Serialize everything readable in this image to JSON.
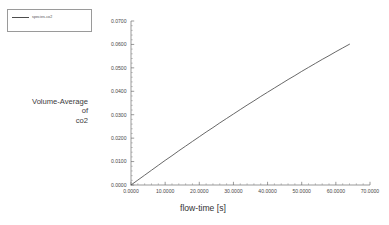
{
  "chart_data": {
    "type": "line",
    "title": "",
    "xlabel": "flow-time [s]",
    "ylabel": "Volume-Average\nof\nco2",
    "ylabel_lines": [
      "Volume-Average",
      "of",
      "co2"
    ],
    "xlim": [
      0.0,
      70.0
    ],
    "ylim": [
      0.0,
      0.07
    ],
    "xticks": [
      0.0,
      10.0,
      20.0,
      30.0,
      40.0,
      50.0,
      60.0,
      70.0
    ],
    "xticklabels": [
      "0.0000",
      "10.0000",
      "20.0000",
      "30.0000",
      "40.0000",
      "50.0000",
      "60.0000",
      "70.0000"
    ],
    "yticks": [
      0.0,
      0.01,
      0.02,
      0.03,
      0.04,
      0.05,
      0.06,
      0.07
    ],
    "yticklabels": [
      "0.0000",
      "0.0100",
      "0.0200",
      "0.0300",
      "0.0400",
      "0.0500",
      "0.0600",
      "0.0700"
    ],
    "x_minor_per_major": 5,
    "y_minor_per_major": 5,
    "grid": false,
    "legend_position": "outside-top-left",
    "legend_entries": [
      "species-co2"
    ],
    "series": [
      {
        "name": "species-co2",
        "color": "#4d4d4d",
        "x": [
          0,
          2,
          4,
          6,
          8,
          10,
          12,
          14,
          16,
          18,
          20,
          22,
          24,
          26,
          28,
          30,
          32,
          34,
          36,
          38,
          40,
          42,
          44,
          46,
          48,
          50,
          52,
          54,
          56,
          58,
          60,
          62,
          64
        ],
        "y": [
          0.0,
          0.0021,
          0.0042,
          0.0063,
          0.0084,
          0.0105,
          0.0125,
          0.0146,
          0.0166,
          0.0186,
          0.0206,
          0.0226,
          0.0245,
          0.0265,
          0.0284,
          0.0303,
          0.0322,
          0.0341,
          0.0359,
          0.0378,
          0.0396,
          0.0414,
          0.0432,
          0.045,
          0.0467,
          0.0485,
          0.0502,
          0.0519,
          0.0536,
          0.0552,
          0.0569,
          0.0585,
          0.0601
        ]
      }
    ]
  },
  "legend": {
    "entries": [
      {
        "label": "species-co2",
        "color": "#4d4d4d"
      }
    ]
  },
  "axes": {
    "y_title_line1": "Volume-Average",
    "y_title_line2": "of",
    "y_title_line3": "co2",
    "x_title": "flow-time [s]"
  },
  "caption": {
    "text": ""
  }
}
